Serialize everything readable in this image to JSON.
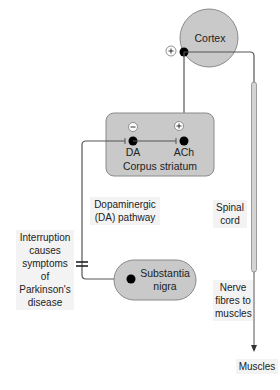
{
  "diagram": {
    "colors": {
      "region_fill": "#c9c9c9",
      "region_stroke": "#8a8a8a",
      "line": "#555555",
      "neuron": "#000000",
      "label_bg": "#f3f3f3"
    },
    "nodes": {
      "cortex": {
        "label": "Cortex",
        "sign": "+"
      },
      "corpus_striatum": {
        "label": "Corpus striatum",
        "da": {
          "label": "DA",
          "sign": "−"
        },
        "ach": {
          "label": "ACh",
          "sign": "+"
        }
      },
      "substantia_nigra": {
        "label_line1": "Substantia",
        "label_line2": "nigra"
      },
      "muscles": {
        "label": "Muscles"
      }
    },
    "labels": {
      "dopaminergic_line1": "Dopaminergic",
      "dopaminergic_line2": "(DA) pathway",
      "interruption_line1": "Interruption",
      "interruption_line2": "causes",
      "interruption_line3": "symptoms of",
      "interruption_line4": "Parkinson's",
      "interruption_line5": "disease",
      "spinal_line1": "Spinal",
      "spinal_line2": "cord",
      "nerve_line1": "Nerve",
      "nerve_line2": "fibres to",
      "nerve_line3": "muscles"
    },
    "edges": [
      {
        "from": "cortex",
        "to": "corpus_striatum.ach",
        "type": "excitatory"
      },
      {
        "from": "substantia_nigra",
        "to": "corpus_striatum.da",
        "type": "dopaminergic",
        "note": "interruption marked"
      },
      {
        "from": "corpus_striatum.da",
        "to": "corpus_striatum.ach",
        "type": "inhibitory"
      },
      {
        "from": "cortex",
        "to": "muscles",
        "via": "spinal cord",
        "type": "motor"
      }
    ]
  }
}
